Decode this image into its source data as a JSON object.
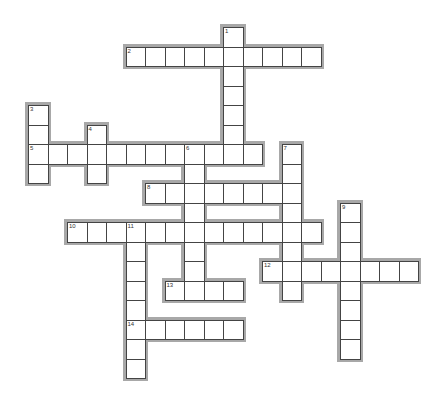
{
  "puzzle": {
    "type": "crossword",
    "grid": {
      "origin_x": 28,
      "origin_y": 27,
      "cell_size": 19.5,
      "halo": 3,
      "halo_color": "#a8a8a8",
      "border_color": "#444444"
    },
    "words": [
      {
        "number": "1",
        "direction": "down",
        "row": 0,
        "col": 10,
        "length": 7
      },
      {
        "number": "2",
        "direction": "across",
        "row": 1,
        "col": 5,
        "length": 10
      },
      {
        "number": "3",
        "direction": "down",
        "row": 4,
        "col": 0,
        "length": 4
      },
      {
        "number": "4",
        "direction": "down",
        "row": 5,
        "col": 3,
        "length": 3
      },
      {
        "number": "5",
        "direction": "across",
        "row": 6,
        "col": 0,
        "length": 12
      },
      {
        "number": "6",
        "direction": "down",
        "row": 6,
        "col": 8,
        "length": 8
      },
      {
        "number": "7",
        "direction": "down",
        "row": 6,
        "col": 13,
        "length": 8
      },
      {
        "number": "8",
        "direction": "across",
        "row": 8,
        "col": 6,
        "length": 8
      },
      {
        "number": "9",
        "direction": "down",
        "row": 9,
        "col": 16,
        "length": 8
      },
      {
        "number": "10",
        "direction": "across",
        "row": 10,
        "col": 2,
        "length": 13
      },
      {
        "number": "11",
        "direction": "down",
        "row": 10,
        "col": 5,
        "length": 8
      },
      {
        "number": "12",
        "direction": "across",
        "row": 12,
        "col": 12,
        "length": 8
      },
      {
        "number": "13",
        "direction": "across",
        "row": 13,
        "col": 7,
        "length": 4
      },
      {
        "number": "14",
        "direction": "across",
        "row": 15,
        "col": 5,
        "length": 6
      }
    ]
  }
}
